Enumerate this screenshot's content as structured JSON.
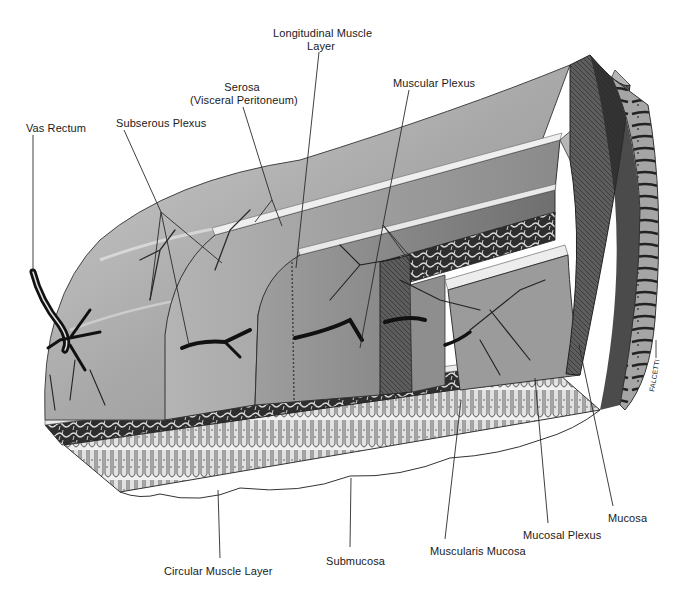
{
  "figure": {
    "signature": "FALCETTI",
    "colors": {
      "background": "#ffffff",
      "label_text": "#1a1a1a",
      "leader_line": "#2a2a2a",
      "serosa_surface": "#a8a8a8",
      "longitudinal_muscle": "#9a9a9a",
      "circular_muscle": "#8c8c8c",
      "submucosa": "#3a3a3a",
      "mucosa": "#d8d8d8",
      "vessel": "#151515"
    }
  },
  "labels": [
    {
      "id": "vas-rectum",
      "text": "Vas Rectum",
      "x": 26,
      "y": 122,
      "lines": [
        [
          33,
          135,
          33,
          272
        ]
      ]
    },
    {
      "id": "subserous-plexus",
      "text": "Subserous Plexus",
      "x": 116,
      "y": 117,
      "lines": [
        [
          124,
          130,
          161,
          212
        ],
        [
          161,
          212,
          150,
          300
        ],
        [
          161,
          212,
          222,
          263
        ],
        [
          161,
          212,
          189,
          345
        ]
      ]
    },
    {
      "id": "serosa",
      "text": "Serosa",
      "text2": "(Visceral Peritoneum)",
      "x": 190,
      "y": 81,
      "lines": [
        [
          243,
          107,
          272,
          200
        ],
        [
          272,
          200,
          255,
          222
        ],
        [
          272,
          200,
          282,
          226
        ]
      ]
    },
    {
      "id": "longitudinal-muscle-layer",
      "text": "Longitudinal Muscle",
      "text2": "Layer",
      "x": 274,
      "y": 27,
      "lines": [
        [
          319,
          52,
          296,
          268
        ]
      ]
    },
    {
      "id": "muscular-plexus",
      "text": "Muscular Plexus",
      "x": 393,
      "y": 77,
      "lines": [
        [
          409,
          90,
          383,
          225
        ],
        [
          383,
          225,
          360,
          348
        ],
        [
          383,
          225,
          410,
          262
        ],
        [
          383,
          225,
          426,
          275
        ]
      ]
    },
    {
      "id": "circular-muscle-layer",
      "text": "Circular Muscle Layer",
      "x": 164,
      "y": 565,
      "lines": [
        [
          220,
          558,
          218,
          490
        ]
      ]
    },
    {
      "id": "submucosa",
      "text": "Submucosa",
      "x": 326,
      "y": 555,
      "lines": [
        [
          350,
          547,
          351,
          478
        ]
      ]
    },
    {
      "id": "muscularis-mucosa",
      "text": "Muscularis Mucosa",
      "x": 430,
      "y": 545,
      "lines": [
        [
          445,
          539,
          461,
          400
        ]
      ]
    },
    {
      "id": "mucosal-plexus",
      "text": "Mucosal Plexus",
      "x": 523,
      "y": 529,
      "lines": [
        [
          548,
          523,
          535,
          378
        ]
      ]
    },
    {
      "id": "mucosa",
      "text": "Mucosa",
      "x": 608,
      "y": 512,
      "lines": [
        [
          613,
          506,
          579,
          345
        ]
      ]
    }
  ]
}
